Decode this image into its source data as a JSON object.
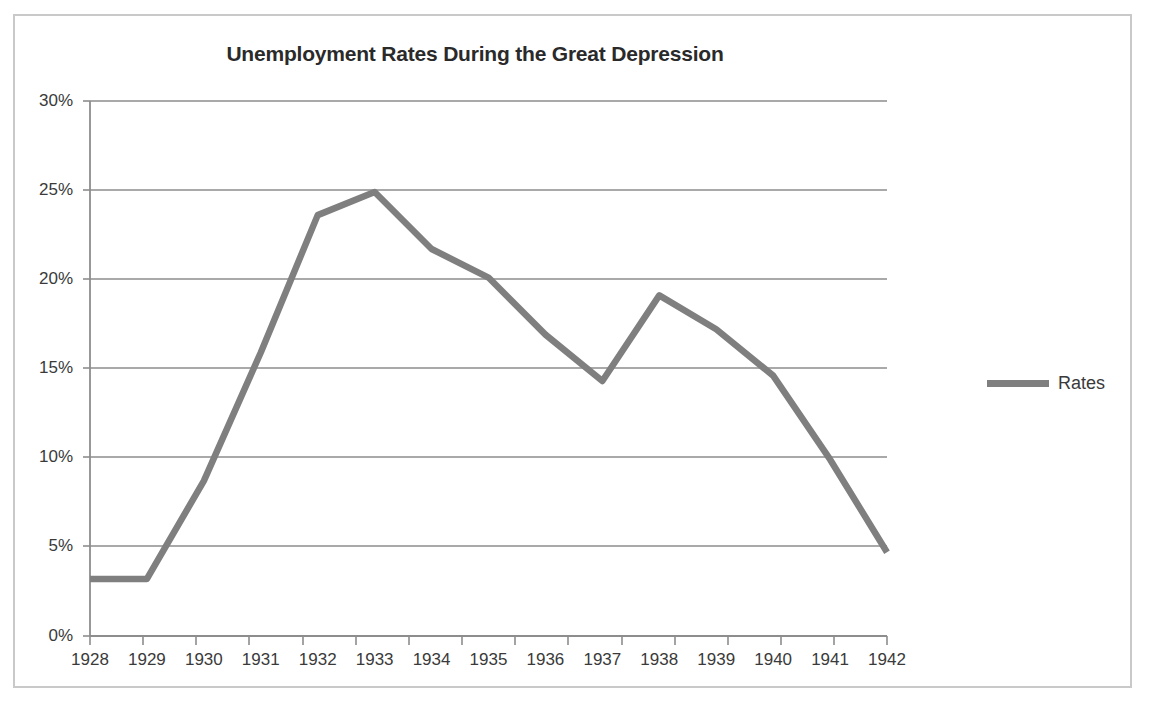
{
  "chart_data": {
    "type": "line",
    "title": "Unemployment Rates During the Great Depression",
    "xlabel": "",
    "ylabel": "",
    "categories": [
      "1928",
      "1929",
      "1930",
      "1931",
      "1932",
      "1933",
      "1934",
      "1935",
      "1936",
      "1937",
      "1938",
      "1939",
      "1940",
      "1941",
      "1942"
    ],
    "series": [
      {
        "name": "Rates",
        "color": "#7f7f7f",
        "values": [
          3.2,
          3.2,
          8.7,
          15.9,
          23.6,
          24.9,
          21.7,
          20.1,
          16.9,
          14.3,
          19.1,
          17.2,
          14.6,
          9.9,
          4.7
        ]
      }
    ],
    "ylim": [
      0,
      30
    ],
    "ytick_values": [
      0,
      5,
      10,
      15,
      20,
      25,
      30
    ],
    "ytick_labels": [
      "0%",
      "5%",
      "10%",
      "15%",
      "20%",
      "25%",
      "30%"
    ],
    "grid": "horizontal",
    "legend_position": "right",
    "legend_entries": [
      "Rates"
    ]
  },
  "legend": {
    "series_label": "Rates"
  },
  "axes": {
    "y_labels": [
      "30%",
      "25%",
      "20%",
      "15%",
      "10%",
      "5%",
      "0%"
    ],
    "x_labels": [
      "1928",
      "1929",
      "1930",
      "1931",
      "1932",
      "1933",
      "1934",
      "1935",
      "1936",
      "1937",
      "1938",
      "1939",
      "1940",
      "1941",
      "1942"
    ]
  },
  "colors": {
    "line": "#7f7f7f",
    "gridline": "#8d8d8d",
    "axis": "#8d8d8d",
    "frame": "#c9c9c9",
    "text": "#3a3a3a",
    "title": "#2a2a2a"
  }
}
